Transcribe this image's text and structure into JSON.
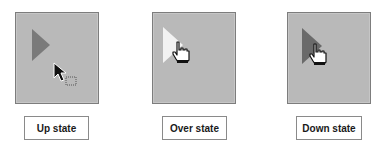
{
  "states": [
    {
      "id": "up",
      "label": "Up state",
      "triangle_color": "#7a7a7a",
      "cursor": "arrow-pointer-with-drag-box"
    },
    {
      "id": "over",
      "label": "Over state",
      "triangle_color": "#f2f2f2",
      "cursor": "hand-pointer"
    },
    {
      "id": "down",
      "label": "Down state",
      "triangle_color": "#6a6a6a",
      "cursor": "hand-pointer"
    }
  ],
  "colors": {
    "button_face": "#b9b9b9",
    "button_border": "#7d7d7d"
  }
}
